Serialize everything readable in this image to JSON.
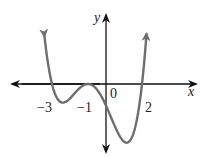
{
  "chart_data": {
    "type": "line",
    "title": "",
    "xlabel": "x",
    "ylabel": "y",
    "function": "f(x) = (x+3)(x+1)^2(x-2)",
    "x_tick_labels": [
      "−3",
      "−1",
      "0",
      "2"
    ],
    "zeros": [
      -3,
      -1,
      2
    ],
    "double_root": -1,
    "xlim": [
      -5.2,
      5.1
    ],
    "grid": false,
    "legend": null,
    "series": [
      {
        "name": "f(x)",
        "color": "#6e6e6e",
        "x": [
          -3.42,
          -3.0,
          -2.6,
          -2.2,
          -1.8,
          -1.4,
          -1.0,
          -0.6,
          -0.2,
          0.0,
          0.4,
          0.8,
          1.2,
          1.6,
          2.0,
          2.25
        ],
        "y": [
          13.3,
          0.0,
          -3.33,
          -4.84,
          -3.65,
          -1.28,
          0.0,
          -1.68,
          -5.7,
          -6.0,
          -8.26,
          -12.5,
          -16.26,
          -13.52,
          0.0,
          13.3
        ]
      }
    ]
  },
  "labels": {
    "x_axis": "x",
    "y_axis": "y",
    "tick_neg3": "−3",
    "tick_neg1": "−1",
    "tick_0": "0",
    "tick_2": "2"
  },
  "colors": {
    "axis": "#111111",
    "curve": "#6e6e6e",
    "text": "#222222"
  }
}
